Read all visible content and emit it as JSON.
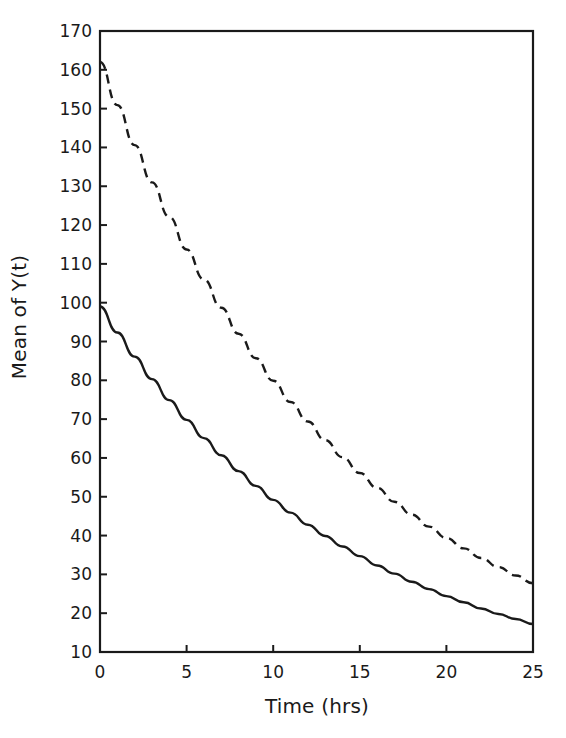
{
  "chart_data": {
    "type": "line",
    "title": "",
    "subtitle": "",
    "xlabel": "Time (hrs)",
    "ylabel": "Mean of Y(t)",
    "xlim": [
      0,
      25
    ],
    "ylim": [
      10,
      170
    ],
    "xticks": [
      0,
      5,
      10,
      15,
      20,
      25
    ],
    "yticks": [
      10,
      20,
      30,
      40,
      50,
      60,
      70,
      80,
      90,
      100,
      110,
      120,
      130,
      140,
      150,
      160,
      170
    ],
    "xtick_labels": [
      "0",
      "5",
      "10",
      "15",
      "20",
      "25"
    ],
    "ytick_labels": [
      "10",
      "20",
      "30",
      "40",
      "50",
      "60",
      "70",
      "80",
      "90",
      "100",
      "110",
      "120",
      "130",
      "140",
      "150",
      "160",
      "170"
    ],
    "grid": false,
    "legend": "none",
    "frame": "box",
    "line_color": "#1a1a1a",
    "background": "#ffffff",
    "x": [
      0,
      1,
      2,
      3,
      4,
      5,
      6,
      7,
      8,
      9,
      10,
      11,
      12,
      13,
      14,
      15,
      16,
      17,
      18,
      19,
      20,
      21,
      22,
      23,
      24,
      25
    ],
    "series": [
      {
        "name": "solid-curve",
        "style": "solid",
        "values": [
          99,
          92.3,
          86.1,
          80.3,
          74.9,
          69.8,
          65.1,
          60.7,
          56.6,
          52.8,
          49.2,
          45.9,
          42.8,
          39.9,
          37.2,
          34.7,
          32.3,
          30.2,
          28.1,
          26.2,
          24.4,
          22.8,
          21.2,
          19.8,
          18.5,
          17.2
        ]
      },
      {
        "name": "dashed-curve",
        "style": "dashed",
        "values": [
          162,
          150.9,
          140.6,
          131.0,
          122.1,
          113.7,
          106.0,
          98.7,
          92.0,
          85.7,
          79.9,
          74.4,
          69.4,
          64.6,
          60.2,
          56.1,
          52.3,
          48.7,
          45.4,
          42.3,
          39.4,
          36.7,
          34.2,
          31.9,
          29.7,
          27.7
        ]
      }
    ]
  }
}
